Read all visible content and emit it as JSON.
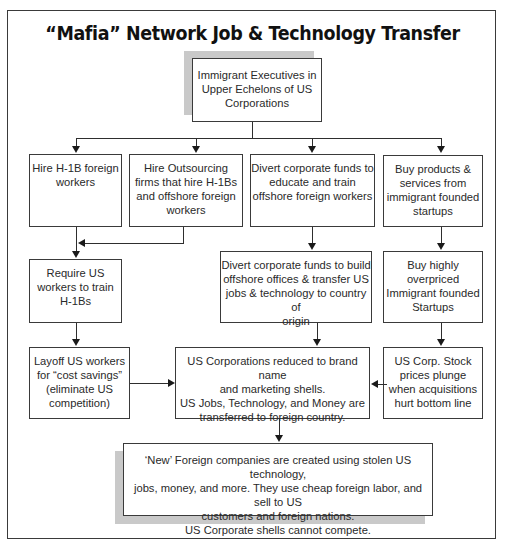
{
  "title": "“Mafia” Network Job & Technology Transfer",
  "nodes": {
    "root": {
      "lines": [
        "Immigrant Executives in",
        "Upper Echelons of US",
        "Corporations"
      ]
    },
    "hire_h1b": {
      "lines": [
        "Hire H-1B foreign",
        "workers"
      ]
    },
    "hire_outsourcing": {
      "lines": [
        "Hire Outsourcing",
        "firms that hire H-1Bs",
        "and offshore foreign",
        "workers"
      ]
    },
    "divert_educate": {
      "lines": [
        "Divert corporate funds to",
        "educate and train",
        "offshore foreign workers"
      ]
    },
    "buy_products": {
      "lines": [
        "Buy products &",
        "services from",
        "immigrant founded",
        "startups"
      ]
    },
    "require_train": {
      "lines": [
        "Require US",
        "workers to train",
        "H-1Bs"
      ]
    },
    "divert_build": {
      "lines": [
        "Divert corporate funds to build",
        "offshore offices & transfer US",
        "jobs & technology to country of",
        "origin"
      ]
    },
    "buy_overpriced": {
      "lines": [
        "Buy highly",
        "overpriced",
        "Immigrant founded",
        "Startups"
      ]
    },
    "layoff": {
      "lines": [
        "Layoff US workers",
        "for “cost savings”",
        "(eliminate US",
        "competition)"
      ]
    },
    "reduced_shells": {
      "lines": [
        "US Corporations reduced to brand name",
        "and marketing shells.",
        "US Jobs, Technology, and Money are",
        "transferred to foreign country."
      ]
    },
    "stock_plunge": {
      "lines": [
        "US Corp. Stock",
        "prices plunge",
        "when acquisitions",
        "hurt bottom line"
      ]
    },
    "new_foreign": {
      "lines": [
        "‘New’ Foreign companies are created using stolen US technology,",
        "jobs, money, and more. They use cheap foreign labor, and sell to US",
        "customers and foreign nations.",
        "US Corporate shells cannot compete."
      ]
    }
  },
  "edges": [
    {
      "from": "root",
      "to": "hire_h1b"
    },
    {
      "from": "root",
      "to": "hire_outsourcing"
    },
    {
      "from": "root",
      "to": "divert_educate"
    },
    {
      "from": "root",
      "to": "buy_products"
    },
    {
      "from": "hire_h1b",
      "to": "require_train"
    },
    {
      "from": "hire_outsourcing",
      "to": "require_train"
    },
    {
      "from": "divert_educate",
      "to": "divert_build"
    },
    {
      "from": "buy_products",
      "to": "buy_overpriced"
    },
    {
      "from": "require_train",
      "to": "layoff"
    },
    {
      "from": "divert_build",
      "to": "reduced_shells"
    },
    {
      "from": "buy_overpriced",
      "to": "stock_plunge"
    },
    {
      "from": "layoff",
      "to": "reduced_shells"
    },
    {
      "from": "stock_plunge",
      "to": "reduced_shells"
    },
    {
      "from": "reduced_shells",
      "to": "new_foreign"
    }
  ],
  "colors": {
    "line": "#2e2e2e",
    "shadow": "#c9c9c9",
    "border": "#3a3a3a"
  }
}
